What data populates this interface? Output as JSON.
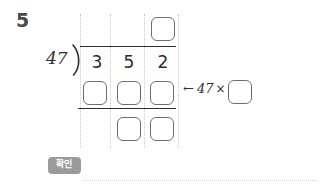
{
  "problem": {
    "number": "5",
    "type": "long-division",
    "divisor": "47",
    "dividend": "352",
    "dividend_digits": [
      "3",
      "5",
      "2"
    ]
  },
  "division": {
    "quotient_box": "",
    "product_boxes": [
      "",
      "",
      ""
    ],
    "remainder_boxes": [
      "",
      ""
    ]
  },
  "annotation": {
    "arrow": "←",
    "operand": "47",
    "times_symbol": "×",
    "multiplier_box": ""
  },
  "actions": {
    "confirm_label": "확인"
  }
}
